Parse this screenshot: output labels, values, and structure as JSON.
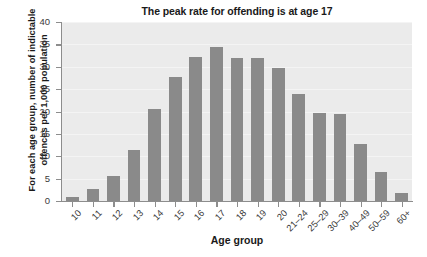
{
  "chart_data": {
    "type": "bar",
    "title": "The peak rate for offending is at age 17",
    "xlabel": "Age group",
    "ylabel": "For each age group, number of indictable offences per 1,000 population",
    "categories": [
      "10",
      "11",
      "12",
      "13",
      "14",
      "15",
      "16",
      "17",
      "18",
      "19",
      "20",
      "21–24",
      "25–29",
      "30–39",
      "40–49",
      "50–59",
      "60+"
    ],
    "values": [
      1.0,
      2.7,
      5.7,
      11.5,
      20.6,
      27.8,
      32.1,
      34.4,
      31.9,
      31.9,
      29.8,
      24.0,
      19.6,
      19.4,
      12.8,
      6.4,
      1.9
    ],
    "ylim": [
      0,
      40
    ],
    "yticks": [
      0,
      5,
      10,
      15,
      20,
      25,
      30,
      35,
      40
    ],
    "ytick_labels": [
      "0",
      "5",
      "10",
      "15",
      "20",
      "25",
      "30",
      "35",
      "40"
    ],
    "grid": true,
    "grid_axis": "y",
    "legend": false,
    "bar_color": "#8a8a8a",
    "plot_background": "#ebebeb",
    "page_background": "#ffffff",
    "text_color": "#1a1a1a",
    "axis_color": "#8d8d8d"
  }
}
